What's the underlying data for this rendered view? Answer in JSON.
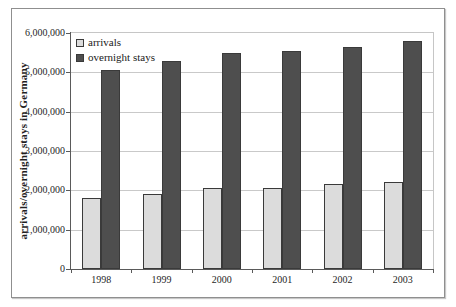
{
  "chart_data": {
    "type": "bar",
    "title": "",
    "ylabel": "arrivals/overnight stays in Germany",
    "xlabel": "",
    "categories": [
      "1998",
      "1999",
      "2000",
      "2001",
      "2002",
      "2003"
    ],
    "series": [
      {
        "name": "arrivals",
        "color": "#dcdcdc",
        "border_color": "#3a3a3a",
        "values": [
          1800000,
          1900000,
          2050000,
          2050000,
          2150000,
          2200000
        ]
      },
      {
        "name": "overnight stays",
        "color": "#4e4e4e",
        "border_color": "#3a3a3a",
        "values": [
          5050000,
          5300000,
          5500000,
          5550000,
          5650000,
          5800000
        ]
      }
    ],
    "ylim": [
      0,
      6000000
    ],
    "ytick_interval": 1000000,
    "ytick_labels": [
      "0",
      "1,000,000",
      "2,000,000",
      "3,000,000",
      "4,000,000",
      "5,000,000",
      "6,000,000"
    ],
    "grid": true,
    "legend_position": "top-left-inside"
  }
}
